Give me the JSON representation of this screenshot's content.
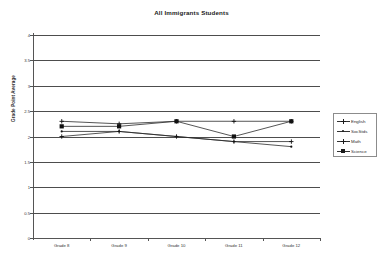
{
  "chart_data": {
    "type": "line",
    "title": "All Immigrants Students",
    "xlabel": "",
    "ylabel": "Grade Point Average",
    "categories": [
      "Grade 8",
      "Grade 9",
      "Grade 10",
      "Grade 11",
      "Grade 12"
    ],
    "ylim": [
      0,
      4
    ],
    "yticks": [
      "0",
      "0.5",
      "1",
      "1.5",
      "2",
      "2.5",
      "3",
      "3.5",
      "4"
    ],
    "ytick_values": [
      0,
      0.5,
      1,
      1.5,
      2,
      2.5,
      3,
      3.5,
      4
    ],
    "grid": true,
    "legend_position": "right",
    "series": [
      {
        "name": "English",
        "marker": "cross",
        "values": [
          2.0,
          2.1,
          2.0,
          1.9,
          1.9
        ]
      },
      {
        "name": "SocStds",
        "marker": "dot",
        "values": [
          2.1,
          2.1,
          2.0,
          1.9,
          1.8
        ]
      },
      {
        "name": "Math",
        "marker": "cross",
        "values": [
          2.3,
          2.25,
          2.3,
          2.3,
          2.3
        ]
      },
      {
        "name": "Science",
        "marker": "square",
        "values": [
          2.2,
          2.2,
          2.3,
          2.0,
          2.3
        ]
      }
    ]
  },
  "legend": {
    "items": [
      {
        "label": "English"
      },
      {
        "label": "SocStds"
      },
      {
        "label": "Math"
      },
      {
        "label": "Science"
      }
    ]
  }
}
